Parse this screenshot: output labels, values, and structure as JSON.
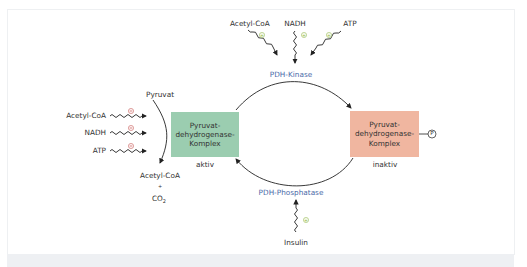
{
  "diagram": {
    "top_effectors": [
      {
        "label": "Acetyl-CoA",
        "sign": "+"
      },
      {
        "label": "NADH",
        "sign": "+"
      },
      {
        "label": "ATP",
        "sign": "+"
      }
    ],
    "kinase_label": "PDH-Kinase",
    "phosphatase_label": "PDH-Phosphatase",
    "bottom_effector": {
      "label": "Insulin",
      "sign": "+"
    },
    "left_effectors": [
      {
        "label": "Acetyl-CoA",
        "sign": "−"
      },
      {
        "label": "NADH",
        "sign": "−"
      },
      {
        "label": "ATP",
        "sign": "−"
      }
    ],
    "substrate": "Pyruvat",
    "products": {
      "line1": "Acetyl-CoA",
      "plus": "+",
      "line2": "CO",
      "sub": "2"
    },
    "active_complex": {
      "line1": "Pyruvat-",
      "line2": "dehydrogenase-",
      "line3": "Komplex",
      "state": "aktiv"
    },
    "inactive_complex": {
      "line1": "Pyruvat-",
      "line2": "dehydrogenase-",
      "line3": "Komplex",
      "state": "inaktiv",
      "phospho": "P"
    },
    "colors": {
      "active_fill": "#9bcdb0",
      "inactive_fill": "#f0b6a0",
      "enzyme_text": "#4a6aa8",
      "plus_sign": "#8fb54a",
      "minus_sign": "#c0504d"
    }
  }
}
